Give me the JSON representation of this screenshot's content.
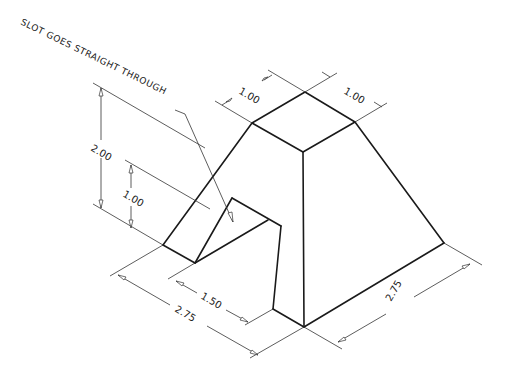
{
  "drawing": {
    "type": "isometric technical drawing",
    "note": "SLOT GOES STRAIGHT THROUGH",
    "dimensions": {
      "top_depth": "1.00",
      "top_width": "1.00",
      "overall_height": "2.00",
      "slot_height": "1.00",
      "slot_width": "1.50",
      "base_left": "2.75",
      "base_right": "2.75"
    },
    "colors": {
      "line": "#1a1a1a",
      "dimension": "#333333",
      "background": "#ffffff"
    }
  }
}
